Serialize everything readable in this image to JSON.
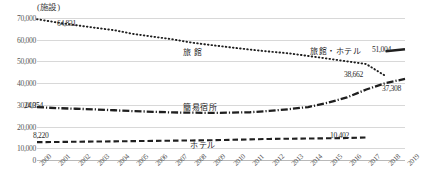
{
  "chart_data": {
    "type": "line",
    "title": "",
    "subtitle": "",
    "xlabel": "",
    "ylabel": "",
    "unit_label": "(施設)",
    "grid": true,
    "legend_position": "inline-annotations",
    "xlim": [
      2000,
      2019
    ],
    "ylim": [
      0,
      70000
    ],
    "ytick_values": [
      0,
      10000,
      20000,
      30000,
      40000,
      50000,
      60000,
      70000
    ],
    "ytick_labels": [
      "0",
      "10,000",
      "20,000",
      "30,000",
      "40,000",
      "50,000",
      "60,000",
      "70,000"
    ],
    "categories": [
      "2000",
      "2001",
      "2002",
      "2003",
      "2004",
      "2005",
      "2006",
      "2007",
      "2008",
      "2009",
      "2010",
      "2011",
      "2012",
      "2013",
      "2014",
      "2015",
      "2016",
      "2017",
      "2018",
      "2019"
    ],
    "x": [
      2000,
      2001,
      2002,
      2003,
      2004,
      2005,
      2006,
      2007,
      2008,
      2009,
      2010,
      2011,
      2012,
      2013,
      2014,
      2015,
      2016,
      2017,
      2018,
      2019
    ],
    "series": [
      {
        "name": "旅館",
        "style": "dotted",
        "values": [
          64831,
          63388,
          62090,
          60900,
          59754,
          58003,
          56788,
          55567,
          54041,
          52925,
          51873,
          50846,
          49936,
          49126,
          47907,
          46693,
          45443,
          44177,
          38662,
          null
        ],
        "end_value": 38662,
        "start_value": 64831
      },
      {
        "name": "簡易宿所",
        "style": "dash-dot",
        "values": [
          24354,
          23900,
          23600,
          23300,
          22900,
          22500,
          22200,
          21900,
          21800,
          21700,
          21800,
          22000,
          22600,
          23400,
          24400,
          26349,
          28822,
          32451,
          35452,
          37308
        ],
        "end_value": 37308,
        "start_value": 24354
      },
      {
        "name": "ホテル",
        "style": "dashed",
        "values": [
          8220,
          8300,
          8400,
          8500,
          8600,
          8700,
          8800,
          8900,
          9000,
          9100,
          9300,
          9500,
          9700,
          9800,
          9900,
          10000,
          10100,
          10402,
          null,
          null
        ],
        "end_value": 10402,
        "start_value": 8220
      },
      {
        "name": "旅館・ホテル",
        "style": "solid",
        "values": [
          null,
          null,
          null,
          null,
          null,
          null,
          null,
          null,
          null,
          null,
          null,
          null,
          null,
          null,
          null,
          null,
          null,
          null,
          50100,
          51004
        ],
        "end_value": 51004
      }
    ],
    "annotations": [
      {
        "text": "64,831",
        "x": 2000,
        "y": 64831,
        "series": "旅館"
      },
      {
        "text": "38,662",
        "x": 2017,
        "y": 38662,
        "series": "旅館"
      },
      {
        "text": "24,354",
        "x": 2000,
        "y": 24354,
        "series": "簡易宿所"
      },
      {
        "text": "37,308",
        "x": 2019,
        "y": 37308,
        "series": "簡易宿所"
      },
      {
        "text": "8,220",
        "x": 2000,
        "y": 8220,
        "series": "ホテル"
      },
      {
        "text": "10,402",
        "x": 2017,
        "y": 10402,
        "series": "ホテル"
      },
      {
        "text": "51,004",
        "x": 2019,
        "y": 51004,
        "series": "旅館・ホテル"
      }
    ],
    "series_labels": [
      {
        "text": "旅 館",
        "series": "旅館"
      },
      {
        "text": "簡易宿所",
        "series": "簡易宿所"
      },
      {
        "text": "ホテル",
        "series": "ホテル"
      },
      {
        "text": "旅館・ホテル",
        "series": "旅館・ホテル"
      }
    ]
  },
  "ann": {
    "a0": "64,831",
    "a1": "38,662",
    "a2": "24,354",
    "a3": "37,308",
    "a4": "8,220",
    "a5": "10,402",
    "a6": "51,004"
  },
  "labels": {
    "ryokan": "旅 館",
    "kanni": "簡易宿所",
    "hotel": "ホテル",
    "ryokan_hotel": "旅館・ホテル"
  },
  "unit": {
    "text": "(施設)"
  },
  "yticks": {
    "t0": "0",
    "t1": "10,000",
    "t2": "20,000",
    "t3": "30,000",
    "t4": "40,000",
    "t5": "50,000",
    "t6": "60,000",
    "t7": "70,000"
  },
  "xticks": {
    "y0": "2000",
    "y1": "2001",
    "y2": "2002",
    "y3": "2003",
    "y4": "2004",
    "y5": "2005",
    "y6": "2006",
    "y7": "2007",
    "y8": "2008",
    "y9": "2009",
    "y10": "2010",
    "y11": "2011",
    "y12": "2012",
    "y13": "2013",
    "y14": "2014",
    "y15": "2015",
    "y16": "2016",
    "y17": "2017",
    "y18": "2018",
    "y19": "2019"
  },
  "colors": {
    "ink": "#1f1f1f",
    "grid": "#d8d8d8",
    "tick": "#555555"
  }
}
